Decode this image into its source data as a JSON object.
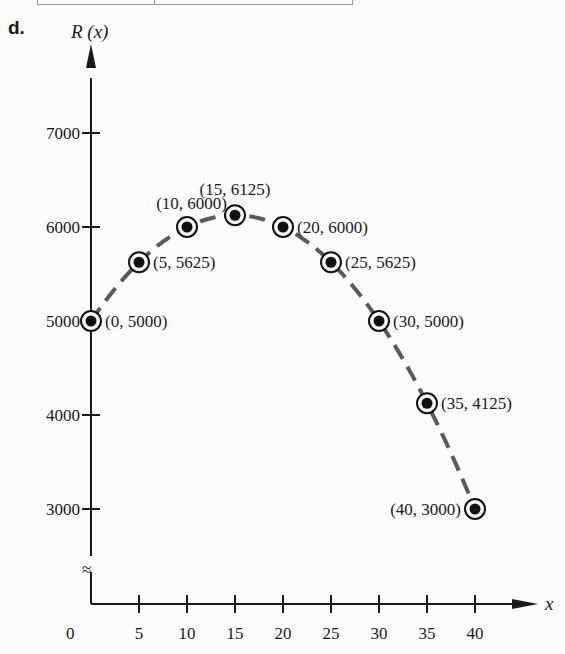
{
  "part_label": "d.",
  "y_axis_label": "R (x)",
  "x_axis_label": "x",
  "origin_label": "0",
  "axis_break_symbol": "≈",
  "colors": {
    "axis": "#1a1a1a",
    "curve": "#5a5a5a",
    "marker": "#111111",
    "background": "#fbfbfb"
  },
  "chart_data": {
    "type": "line",
    "title": "",
    "xlabel": "x",
    "ylabel": "R(x)",
    "x_ticks": [
      5,
      10,
      15,
      20,
      25,
      30,
      35,
      40
    ],
    "y_ticks": [
      3000,
      4000,
      5000,
      6000,
      7000
    ],
    "xlim": [
      0,
      42
    ],
    "ylim": [
      2000,
      7900
    ],
    "y_axis_break": true,
    "grid": false,
    "legend": null,
    "line_style": "dashed",
    "series": [
      {
        "name": "R(x)",
        "x": [
          0,
          5,
          10,
          15,
          20,
          25,
          30,
          35,
          40
        ],
        "values": [
          5000,
          5625,
          6000,
          6125,
          6000,
          5625,
          5000,
          4125,
          3000
        ]
      }
    ],
    "point_labels": [
      "(0, 5000)",
      "(5, 5625)",
      "(10, 6000)",
      "(15, 6125)",
      "(20, 6000)",
      "(25, 5625)",
      "(30, 5000)",
      "(35, 4125)",
      "(40, 3000)"
    ]
  }
}
